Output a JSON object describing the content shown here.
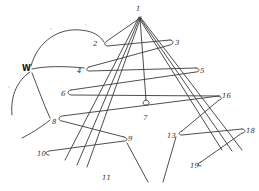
{
  "diagram": {
    "title": "",
    "apex_label": "1",
    "side_label": "W",
    "labels": [
      {
        "id": "n1",
        "text": "1",
        "x": 138,
        "y": 10
      },
      {
        "id": "n2",
        "text": "2",
        "x": 94,
        "y": 46
      },
      {
        "id": "n3",
        "text": "3",
        "x": 175,
        "y": 45
      },
      {
        "id": "nw",
        "text": "W",
        "x": 23,
        "y": 70
      },
      {
        "id": "n4",
        "text": "4",
        "x": 77,
        "y": 73
      },
      {
        "id": "n5",
        "text": "5",
        "x": 200,
        "y": 73
      },
      {
        "id": "n6",
        "text": "6",
        "x": 60,
        "y": 96
      },
      {
        "id": "n7",
        "text": "7",
        "x": 143,
        "y": 120
      },
      {
        "id": "n16",
        "text": "16",
        "x": 222,
        "y": 98
      },
      {
        "id": "n8",
        "text": "8",
        "x": 52,
        "y": 124
      },
      {
        "id": "n9",
        "text": "9",
        "x": 128,
        "y": 141
      },
      {
        "id": "n13",
        "text": "13",
        "x": 167,
        "y": 138
      },
      {
        "id": "n18",
        "text": "18",
        "x": 245,
        "y": 133
      },
      {
        "id": "n10",
        "text": "10",
        "x": 37,
        "y": 156
      },
      {
        "id": "n19",
        "text": "19",
        "x": 190,
        "y": 168
      },
      {
        "id": "n11",
        "text": "11",
        "x": 102,
        "y": 180
      }
    ]
  }
}
